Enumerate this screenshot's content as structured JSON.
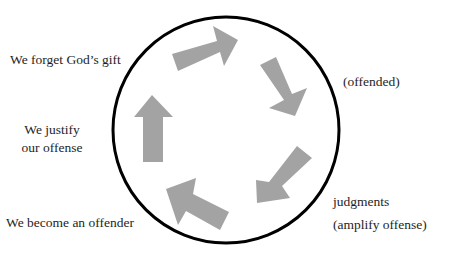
{
  "diagram": {
    "type": "cycle",
    "title": "",
    "colors": {
      "circle": "#000000",
      "arrow": "#a3a3a3",
      "text": "#1e1e1e",
      "background": "#ffffff"
    },
    "labels": {
      "forget": "We forget God’s gift",
      "offended": "(offended)",
      "judgments": "judgments",
      "amplify": "(amplify offense)",
      "become": "We become an offender",
      "justify_line1": "We justify",
      "justify_line2": "our offense"
    },
    "arrows": [
      {
        "id": "top",
        "direction": "right-up"
      },
      {
        "id": "right-upper",
        "direction": "down-right"
      },
      {
        "id": "right-lower",
        "direction": "down-left"
      },
      {
        "id": "bottom",
        "direction": "up-left"
      },
      {
        "id": "left",
        "direction": "up"
      }
    ]
  }
}
